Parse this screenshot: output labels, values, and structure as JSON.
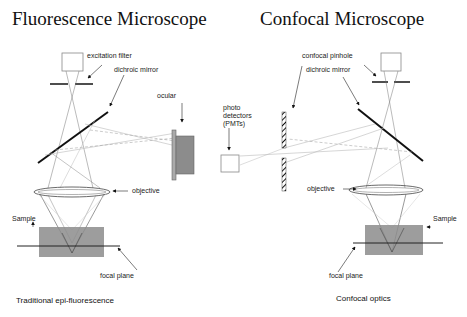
{
  "titles": {
    "left": "Fluorescence Microscope",
    "right": "Confocal Microscope"
  },
  "left_panel": {
    "labels": {
      "excitation_filter": "excitation filter",
      "dichroic_mirror": "dichroic mirror",
      "ocular": "ocular",
      "objective": "objective",
      "sample": "Sample",
      "focal_plane": "focal plane"
    },
    "caption": "Traditional epi-fluorescence"
  },
  "right_panel": {
    "labels": {
      "confocal_pinhole": "confocal pinhole",
      "dichroic_mirror": "dichroic mirror",
      "photo_detectors_line1": "photo",
      "photo_detectors_line2": "detectors",
      "photo_detectors_line3": "(PMTs)",
      "objective": "objective",
      "sample": "Sample",
      "focal_plane": "focal plane"
    },
    "caption": "Confocal optics"
  },
  "colors": {
    "sample_fill": "#8c8c8c",
    "ocular_fill": "#8c8c8c",
    "mirror": "#111111",
    "ray_dark": "#555555",
    "ray_light": "#b0b0b0"
  }
}
